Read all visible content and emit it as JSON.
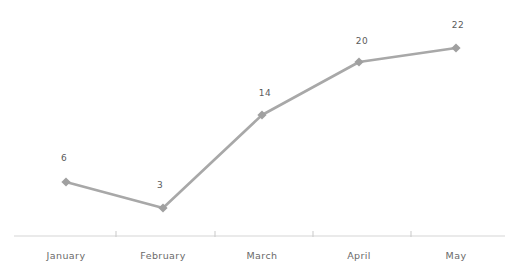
{
  "chart_data": {
    "type": "line",
    "title": "",
    "subtitle": "",
    "xlabel": "",
    "ylabel": "",
    "categories": [
      "January",
      "February",
      "March",
      "April",
      "May"
    ],
    "values": [
      6,
      3,
      14,
      20,
      22
    ],
    "series": [
      {
        "name": "Series 1",
        "values": [
          6,
          3,
          14,
          20,
          22
        ]
      }
    ],
    "data_labels": [
      "6",
      "3",
      "14",
      "20",
      "22"
    ],
    "ylim": [
      0,
      24
    ],
    "grid": false,
    "legend": false,
    "legend_position": "none",
    "y_axis_visible": false,
    "x_axis_visible": true,
    "marker": "diamond",
    "colors": {
      "line": "#a8a8a8",
      "marker": "#a0a0a0",
      "axis": "#d5d5d5",
      "tick": "#c9c9c9",
      "data_label_text": "#5b5b5b",
      "category_label_text": "#6a6a6a",
      "background": "#ffffff"
    },
    "points_px": [
      {
        "x": 66,
        "y": 182
      },
      {
        "x": 163,
        "y": 208
      },
      {
        "x": 262,
        "y": 115
      },
      {
        "x": 359,
        "y": 62
      },
      {
        "x": 456,
        "y": 48
      }
    ],
    "label_px": [
      {
        "x": 64,
        "y": 153
      },
      {
        "x": 160,
        "y": 180
      },
      {
        "x": 265,
        "y": 88
      },
      {
        "x": 362,
        "y": 36
      },
      {
        "x": 458,
        "y": 20
      }
    ],
    "category_px": [
      66,
      163,
      262,
      359,
      456
    ],
    "axis_px": {
      "y": 236,
      "x_start": 14,
      "x_end": 505
    },
    "tick_px": [
      116,
      215,
      313,
      411
    ]
  }
}
